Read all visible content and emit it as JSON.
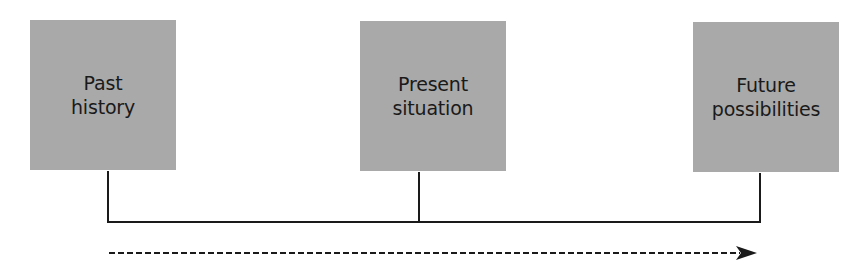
{
  "diagram": {
    "boxes": [
      {
        "line1": "Past",
        "line2": "history"
      },
      {
        "line1": "Present",
        "line2": "situation"
      },
      {
        "line1": "Future",
        "line2": "possibilities"
      }
    ],
    "arrow": {
      "style": "dashed",
      "direction": "left-to-right"
    },
    "colors": {
      "box_fill": "#a9a9a9",
      "line": "#1a1a1a",
      "text": "#1a1a1a"
    }
  }
}
